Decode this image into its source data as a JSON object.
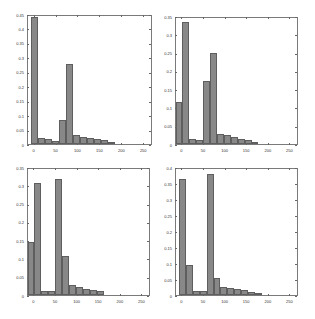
{
  "chart_data": [
    {
      "type": "bar",
      "position": "top-left",
      "title": "",
      "xlabel": "",
      "ylabel": "",
      "xlim": [
        -15,
        270
      ],
      "ylim": [
        0,
        0.45
      ],
      "xticks": [
        0,
        50,
        100,
        150,
        200,
        250
      ],
      "yticks": [
        0,
        0.05,
        0.1,
        0.15,
        0.2,
        0.25,
        0.3,
        0.35,
        0.4,
        0.45
      ],
      "ytick_labels": [
        "0",
        "0.05",
        "0.1",
        "0.15",
        "0.2",
        "0.25",
        "0.3",
        "0.35",
        "0.4",
        "0.45"
      ],
      "bin_width": 16,
      "bin_centers": [
        0,
        16,
        32,
        48,
        64,
        80,
        96,
        112,
        128,
        144,
        160,
        176
      ],
      "values": [
        0.44,
        0.02,
        0.018,
        0.01,
        0.082,
        0.278,
        0.03,
        0.025,
        0.02,
        0.017,
        0.013,
        0.004
      ],
      "grid": false
    },
    {
      "type": "bar",
      "position": "top-right",
      "title": "",
      "xlabel": "",
      "ylabel": "",
      "xlim": [
        -15,
        270
      ],
      "ylim": [
        0,
        0.35
      ],
      "xticks": [
        0,
        50,
        100,
        150,
        200,
        250
      ],
      "yticks": [
        0,
        0.05,
        0.1,
        0.15,
        0.2,
        0.25,
        0.3,
        0.35
      ],
      "ytick_labels": [
        "0",
        "0.05",
        "0.1",
        "0.15",
        "0.2",
        "0.25",
        "0.3",
        "0.35"
      ],
      "bin_width": 16,
      "bin_centers": [
        -8,
        8,
        24,
        40,
        56,
        72,
        88,
        104,
        120,
        136,
        152,
        168
      ],
      "values": [
        0.115,
        0.333,
        0.015,
        0.012,
        0.172,
        0.25,
        0.028,
        0.024,
        0.018,
        0.015,
        0.011,
        0.002
      ],
      "grid": false
    },
    {
      "type": "bar",
      "position": "bottom-left",
      "title": "",
      "xlabel": "",
      "ylabel": "",
      "xlim": [
        -15,
        270
      ],
      "ylim": [
        0,
        0.35
      ],
      "xticks": [
        0,
        50,
        100,
        150,
        200,
        250
      ],
      "yticks": [
        0,
        0.05,
        0.1,
        0.15,
        0.2,
        0.25,
        0.3,
        0.35
      ],
      "ytick_labels": [
        "0",
        "0.05",
        "0.1",
        "0.15",
        "0.2",
        "0.25",
        "0.3",
        "0.35"
      ],
      "bin_width": 16,
      "bin_centers": [
        -8,
        8,
        24,
        40,
        56,
        72,
        88,
        104,
        120,
        136,
        152
      ],
      "values": [
        0.145,
        0.307,
        0.012,
        0.012,
        0.317,
        0.107,
        0.027,
        0.022,
        0.017,
        0.014,
        0.01
      ],
      "grid": false
    },
    {
      "type": "bar",
      "position": "bottom-right",
      "title": "",
      "xlabel": "",
      "ylabel": "",
      "xlim": [
        -15,
        270
      ],
      "ylim": [
        0,
        0.4
      ],
      "xticks": [
        0,
        50,
        100,
        150,
        200,
        250
      ],
      "yticks": [
        0,
        0.05,
        0.1,
        0.15,
        0.2,
        0.25,
        0.3,
        0.35,
        0.4
      ],
      "ytick_labels": [
        "0",
        "0.05",
        "0.1",
        "0.15",
        "0.2",
        "0.25",
        "0.3",
        "0.35",
        "0.4"
      ],
      "bin_width": 16,
      "bin_centers": [
        0,
        16,
        32,
        48,
        64,
        80,
        96,
        112,
        128,
        144,
        160,
        176
      ],
      "values": [
        0.362,
        0.095,
        0.012,
        0.013,
        0.378,
        0.052,
        0.026,
        0.022,
        0.018,
        0.015,
        0.01,
        0.002
      ],
      "grid": false
    }
  ],
  "style": {
    "bar_color": "#888888",
    "bar_edge": "#5e5e5e",
    "frame_color": "#7a7a7a"
  },
  "layout": [
    {
      "left": 27,
      "top": 15,
      "width": 125,
      "height": 130
    },
    {
      "left": 175,
      "top": 17,
      "width": 123,
      "height": 128
    },
    {
      "left": 27,
      "top": 168,
      "width": 123,
      "height": 128
    },
    {
      "left": 175,
      "top": 168,
      "width": 123,
      "height": 128
    }
  ]
}
